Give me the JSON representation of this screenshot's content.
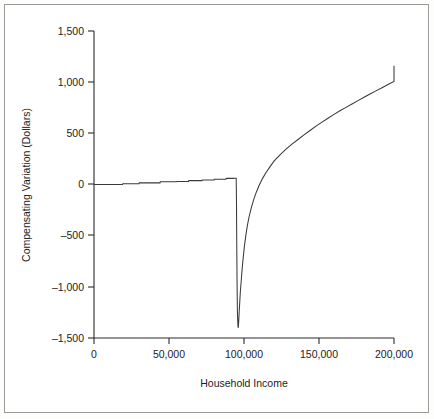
{
  "figure": {
    "background_color": "#ffffff",
    "frame_color": "#9a9a98",
    "line_color": "#3a3a3a",
    "axis_color": "#2b2b2b"
  },
  "chart_data": {
    "type": "line",
    "title": "",
    "xlabel": "Household Income",
    "ylabel": "Compensating Variation (Dollars)",
    "xlim": [
      0,
      200000
    ],
    "ylim": [
      -1500,
      1500
    ],
    "grid": false,
    "legend": null,
    "xticks": [
      0,
      50000,
      100000,
      150000,
      200000
    ],
    "xtick_labels": [
      "0",
      "50,000",
      "100,000",
      "150,000",
      "200,000"
    ],
    "yticks": [
      -1500,
      -1000,
      -500,
      0,
      500,
      1000,
      1500
    ],
    "ytick_labels": [
      "–1,500",
      "–1,000",
      "–500",
      "0",
      "500",
      "1,000",
      "1,500"
    ],
    "series": [
      {
        "name": "Compensating Variation",
        "x": [
          0,
          8000,
          14000,
          19000,
          19200,
          30000,
          30200,
          44000,
          44200,
          55000,
          55200,
          63000,
          63200,
          72000,
          72200,
          80000,
          80200,
          88000,
          88200,
          93000,
          93200,
          94800,
          95000,
          95100,
          95200,
          95300,
          95400,
          95500,
          95600,
          95800,
          96000,
          96200,
          96500,
          96800,
          97200,
          97600,
          98200,
          98800,
          99500,
          100300,
          101200,
          102200,
          103400,
          104800,
          106400,
          108200,
          110200,
          112400,
          114800,
          117400,
          120000,
          124000,
          128000,
          132000,
          136000,
          140000,
          144000,
          148000,
          152000,
          156000,
          160000,
          164000,
          168000,
          172000,
          176000,
          180000,
          184000,
          188000,
          192000,
          196000,
          200000
        ],
        "y": [
          0,
          0,
          0,
          0,
          8,
          8,
          16,
          16,
          26,
          26,
          30,
          30,
          38,
          38,
          44,
          44,
          52,
          52,
          60,
          60,
          62,
          62,
          -180,
          -420,
          -640,
          -820,
          -980,
          -1120,
          -1240,
          -1330,
          -1390,
          -1400,
          -1330,
          -1240,
          -1140,
          -1040,
          -930,
          -820,
          -710,
          -600,
          -500,
          -405,
          -315,
          -230,
          -150,
          -75,
          -5,
          60,
          120,
          175,
          228,
          290,
          345,
          395,
          440,
          485,
          528,
          570,
          610,
          648,
          685,
          720,
          754,
          787,
          820,
          852,
          884,
          915,
          946,
          977,
          1008
        ],
        "end_value": 1160,
        "min_value": -1400,
        "knee_x": 118000,
        "knee_y": 650
      }
    ]
  }
}
